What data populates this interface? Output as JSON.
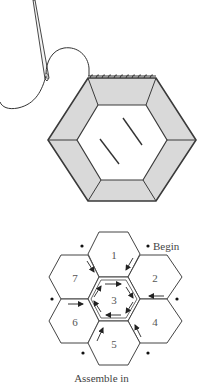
{
  "figure": {
    "illustration_1": {
      "description": "Needle and thread whip-stitching the top edge of a fabric-covered paper hexagon",
      "colors": {
        "fabric": "#d9d9d9",
        "line": "#3a3a3a",
        "background": "#ffffff"
      }
    },
    "illustration_2": {
      "hexagon_labels": [
        "1",
        "2",
        "3",
        "4",
        "5",
        "6",
        "7"
      ],
      "begin_label": "Begin",
      "caption": "Assemble in"
    }
  }
}
